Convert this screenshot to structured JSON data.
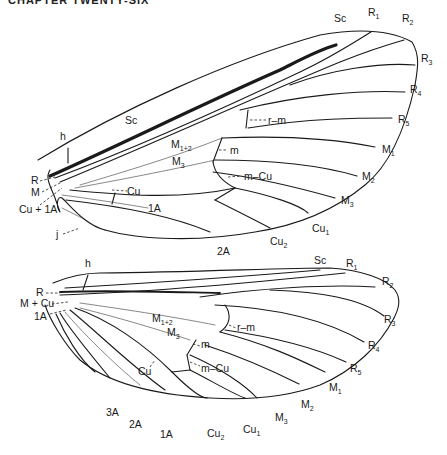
{
  "header": {
    "text": "CHAPTER TWENTY-SIX"
  },
  "forewing": {
    "labels": {
      "Sc_top": "Sc",
      "R1": "R",
      "R1_sub": "1",
      "R2": "R",
      "R2_sub": "2",
      "R3": "R",
      "R3_sub": "3",
      "R4": "R",
      "R4_sub": "4",
      "R5": "R",
      "R5_sub": "5",
      "M1": "M",
      "M1_sub": "1",
      "M2": "M",
      "M2_sub": "2",
      "M3_margin": "M",
      "M3_margin_sub": "3",
      "Cu1": "Cu",
      "Cu1_sub": "1",
      "Cu2": "Cu",
      "Cu2_sub": "2",
      "A2": "2A",
      "h": "h",
      "Sc": "Sc",
      "M12": "M",
      "M12_sub": "1+2",
      "M3": "M",
      "M3_sub": "3",
      "rm": "r–m",
      "m": "m",
      "mCu": "m–Cu",
      "Cu": "Cu",
      "A1": "1A",
      "R": "R",
      "M": "M",
      "CuA": "Cu + 1A",
      "j": "j"
    }
  },
  "hindwing": {
    "labels": {
      "h": "h",
      "Sc": "Sc",
      "R1": "R",
      "R1_sub": "1",
      "R2": "R",
      "R2_sub": "2",
      "R3": "R",
      "R3_sub": "3",
      "R4": "R",
      "R4_sub": "4",
      "R5": "R",
      "R5_sub": "5",
      "M1": "M",
      "M1_sub": "1",
      "M2": "M",
      "M2_sub": "2",
      "M3_margin": "M",
      "M3_margin_sub": "3",
      "Cu1": "Cu",
      "Cu1_sub": "1",
      "Cu2": "Cu",
      "Cu2_sub": "2",
      "A1": "1A",
      "A2": "2A",
      "A3": "3A",
      "R": "R",
      "MCu": "M + Cu",
      "A1_base": "1A",
      "M12": "M",
      "M12_sub": "1+2",
      "M3": "M",
      "M3_sub": "3",
      "rm": "r–m",
      "m": "m",
      "mCu": "m–Cu",
      "Cu": "Cu"
    }
  }
}
